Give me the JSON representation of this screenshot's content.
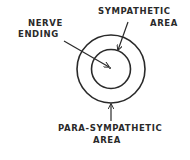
{
  "diagram": {
    "labels": {
      "nerve_line1": "NERVE",
      "nerve_line2": "ENDING",
      "symp_line1": "SYMPATHETIC",
      "symp_line2": "AREA",
      "para_line1": "PARA-SYMPATHETIC",
      "para_line2": "AREA"
    },
    "colors": {
      "ink": "#2a2a2a",
      "background": "#ffffff"
    }
  }
}
